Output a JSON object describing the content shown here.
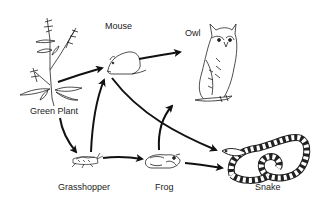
{
  "diagram": {
    "type": "food-web",
    "nodes": [
      {
        "id": "plant",
        "label": "Green Plant"
      },
      {
        "id": "mouse",
        "label": "Mouse"
      },
      {
        "id": "owl",
        "label": "Owl"
      },
      {
        "id": "grasshopper",
        "label": "Grasshopper"
      },
      {
        "id": "frog",
        "label": "Frog"
      },
      {
        "id": "snake",
        "label": "Snake"
      }
    ],
    "edges": [
      {
        "from": "plant",
        "to": "mouse"
      },
      {
        "from": "plant",
        "to": "grasshopper"
      },
      {
        "from": "grasshopper",
        "to": "mouse"
      },
      {
        "from": "grasshopper",
        "to": "frog"
      },
      {
        "from": "mouse",
        "to": "owl"
      },
      {
        "from": "mouse",
        "to": "snake"
      },
      {
        "from": "frog",
        "to": "owl"
      },
      {
        "from": "frog",
        "to": "snake"
      }
    ]
  }
}
